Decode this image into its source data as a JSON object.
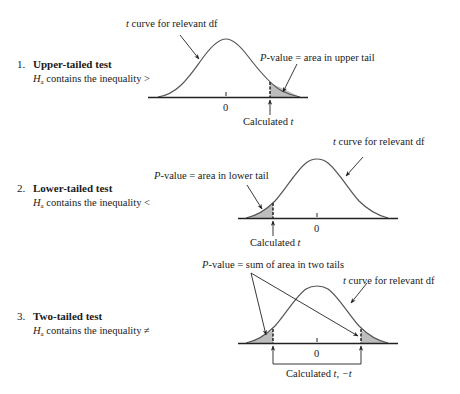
{
  "cases": [
    {
      "number": "1.",
      "title": "Upper-tailed test",
      "hypothesis_symbol": "H",
      "hypothesis_sub": "a",
      "hypothesis_text": " contains the inequality >",
      "curve_label_t": "t",
      "curve_label": " curve for relevant df",
      "pvalue_P": "P",
      "pvalue_label": "-value = area in upper tail",
      "zero_label": "0",
      "calc_label": "Calculated ",
      "calc_t": "t"
    },
    {
      "number": "2.",
      "title": "Lower-tailed test",
      "hypothesis_symbol": "H",
      "hypothesis_sub": "a",
      "hypothesis_text": " contains the inequality <",
      "curve_label_t": "t",
      "curve_label": " curve for relevant df",
      "pvalue_P": "P",
      "pvalue_label": "-value = area in lower tail",
      "zero_label": "0",
      "calc_label": "Calculated ",
      "calc_t": "t"
    },
    {
      "number": "3.",
      "title": "Two-tailed test",
      "hypothesis_symbol": "H",
      "hypothesis_sub": "a",
      "hypothesis_text": " contains the inequality ≠",
      "curve_label_t": "t",
      "curve_label": " curve for relevant df",
      "pvalue_P": "P",
      "pvalue_label": "-value = sum of area in two tails",
      "zero_label": "0",
      "calc_label": "Calculated ",
      "calc_t": "t, −t"
    }
  ],
  "colors": {
    "curve": "#555555",
    "shade": "#bdbdbd",
    "axis": "#222222",
    "text": "#1a1a1a"
  }
}
